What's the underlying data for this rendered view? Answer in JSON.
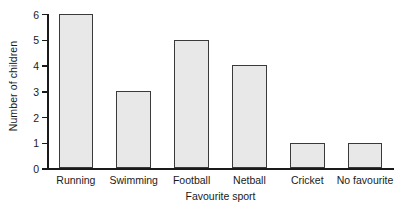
{
  "chart_data": {
    "type": "bar",
    "title": "",
    "subtitle": "",
    "xlabel": "Favourite sport",
    "ylabel": "Number of children",
    "categories": [
      "Running",
      "Swimming",
      "Football",
      "Netball",
      "Cricket",
      "No favourite"
    ],
    "values": [
      6,
      3,
      5,
      4,
      1,
      1
    ],
    "series": [
      {
        "name": "Number of children",
        "values": [
          6,
          3,
          5,
          4,
          1,
          1
        ]
      }
    ],
    "ylim": [
      0,
      6
    ],
    "ytick_labels": [
      "0",
      "1",
      "2",
      "3",
      "4",
      "5",
      "6"
    ],
    "ytick_values": [
      0,
      1,
      2,
      3,
      4,
      5,
      6
    ],
    "grid": false,
    "legend": false,
    "legend_position": "none",
    "annotations": [],
    "bar_fill_color": "#e8e8e8",
    "bar_edge_color": "#3a3a3a",
    "axis_color": "#1a1a1a",
    "background_color": "#ffffff"
  }
}
